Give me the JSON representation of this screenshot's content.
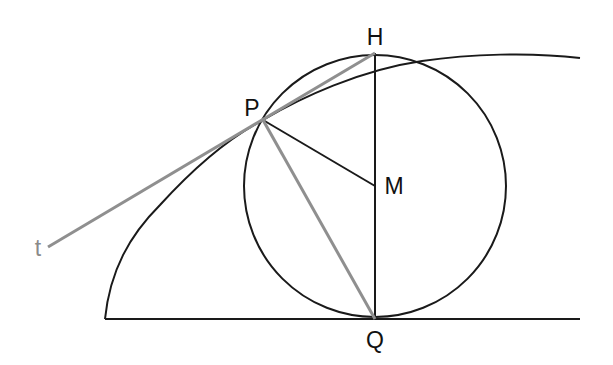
{
  "diagram": {
    "type": "geometry",
    "colors": {
      "background": "#ffffff",
      "black_stroke": "#1a1a1a",
      "grey_stroke": "#8f8f8f",
      "label": "#111111",
      "grey_label": "#8a8a8a"
    },
    "points": {
      "P": {
        "label": "P",
        "x": 263,
        "y": 120
      },
      "H": {
        "label": "H",
        "x": 375,
        "y": 53
      },
      "M": {
        "label": "M",
        "x": 375,
        "y": 186
      },
      "Q": {
        "label": "Q",
        "x": 375,
        "y": 319
      }
    },
    "circle": {
      "cx": 375,
      "cy": 186,
      "r": 131
    },
    "baseline": {
      "x1": 105,
      "y1": 319,
      "x2": 580,
      "y2": 319
    },
    "tangent_line": {
      "label": "t",
      "x1": 48,
      "y1": 247,
      "x2": 375,
      "y2": 53
    },
    "segments": [
      {
        "name": "PM",
        "from": "P",
        "to": "M",
        "color": "black"
      },
      {
        "name": "HQ",
        "from": "H",
        "to": "Q",
        "color": "black"
      },
      {
        "name": "PQ",
        "from": "P",
        "to": "Q",
        "color": "grey"
      },
      {
        "name": "PH",
        "from": "P",
        "to": "H",
        "color": "grey"
      }
    ],
    "labels": {
      "P": "P",
      "H": "H",
      "M": "M",
      "Q": "Q",
      "t": "t"
    }
  }
}
